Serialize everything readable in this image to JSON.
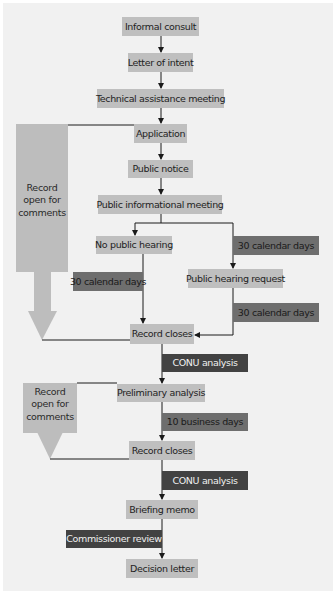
{
  "diagram": {
    "type": "flowchart",
    "steps": {
      "informal_consult": "Informal consult",
      "letter_of_intent": "Letter of intent",
      "technical_assistance_meeting": "Technical assistance meeting",
      "application": "Application",
      "public_notice": "Public notice",
      "public_informational_meeting": "Public informational meeting",
      "no_public_hearing": "No public hearing",
      "public_hearing_request": "Public hearing request",
      "record_closes_1": "Record closes",
      "preliminary_analysis": "Preliminary analysis",
      "record_closes_2": "Record closes",
      "briefing_memo": "Briefing memo",
      "decision_letter": "Decision letter"
    },
    "durations": {
      "left_30_days": "30 calendar days",
      "right_30_days_top": "30 calendar days",
      "right_30_days_bottom": "30 calendar days",
      "business_days_10": "10 business days"
    },
    "actions": {
      "conu_analysis_1": "CONU analysis",
      "conu_analysis_2": "CONU analysis",
      "commissioner_review": "Commissioner review"
    },
    "comment_periods": {
      "first": [
        "Record",
        "open for",
        "comments"
      ],
      "second": [
        "Record",
        "open for",
        "comments"
      ]
    },
    "colors": {
      "step_box": "#bfbfbf",
      "duration_box": "#6e6e6e",
      "action_box": "#424242",
      "comment_arrow": "#bdbdbd",
      "background": "#f1f1f1"
    }
  }
}
